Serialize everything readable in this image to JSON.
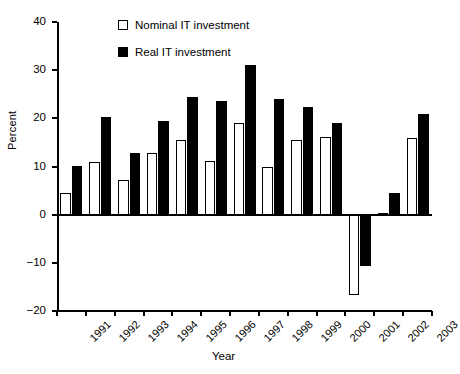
{
  "chart_data": {
    "type": "bar",
    "title": "",
    "xlabel": "Year",
    "ylabel": "Percent",
    "categories": [
      "1991",
      "1992",
      "1993",
      "1994",
      "1995",
      "1996",
      "1997",
      "1998",
      "1999",
      "2000",
      "2001",
      "2002",
      "2003"
    ],
    "series": [
      {
        "name": "Nominal IT investment",
        "style": "open",
        "color": "#ffffff",
        "edge_color": "#000000",
        "values": [
          4.5,
          10.9,
          7.3,
          12.7,
          15.6,
          11.1,
          19.1,
          9.8,
          15.4,
          16.2,
          -16.7,
          0.3,
          15.9
        ]
      },
      {
        "name": "Real IT investment",
        "style": "filled",
        "color": "#000000",
        "edge_color": "#000000",
        "values": [
          10.1,
          20.3,
          12.8,
          19.5,
          24.5,
          23.6,
          31.0,
          24.0,
          22.4,
          19.0,
          -10.7,
          4.6,
          20.8
        ]
      }
    ],
    "ylim": [
      -20,
      40
    ],
    "yticks": [
      -20,
      -10,
      0,
      10,
      20,
      30,
      40
    ],
    "ytick_labels": [
      "−20",
      "−10",
      "0",
      "10",
      "20",
      "30",
      "40"
    ],
    "grid": false,
    "legend_position": "upper-left-inside",
    "xtick_rotation": -45
  },
  "legend": {
    "entries": [
      {
        "label": "Nominal IT investment"
      },
      {
        "label": "Real IT investment"
      }
    ]
  }
}
